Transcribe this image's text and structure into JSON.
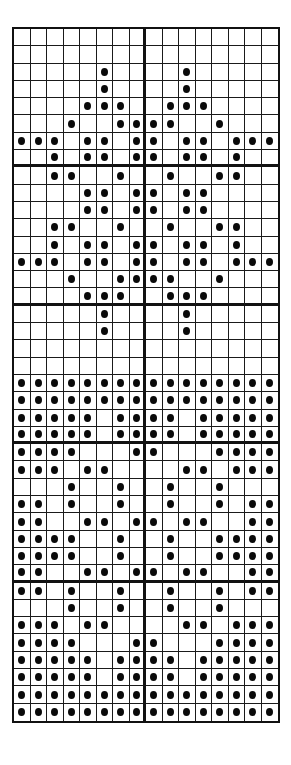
{
  "pattern": {
    "type": "knitting-chart",
    "columns": 16,
    "rows": 40,
    "major_grid_every_rows": 8,
    "major_grid_every_cols": 8,
    "symbol": "filled-dot",
    "symbol_color": "#0a0a0a",
    "grid_color": "#1a1a1a",
    "background_color": "#ffffff",
    "filled_cells_by_row": [
      [],
      [],
      [
        5,
        10
      ],
      [
        5,
        10
      ],
      [
        4,
        5,
        6,
        9,
        10,
        11
      ],
      [
        3,
        6,
        7,
        8,
        9,
        12
      ],
      [
        0,
        1,
        2,
        4,
        5,
        7,
        8,
        10,
        11,
        13,
        14,
        15
      ],
      [
        2,
        4,
        5,
        7,
        8,
        10,
        11,
        13
      ],
      [
        2,
        3,
        6,
        9,
        12,
        13
      ],
      [
        4,
        5,
        7,
        8,
        10,
        11
      ],
      [
        4,
        5,
        7,
        8,
        10,
        11
      ],
      [
        2,
        3,
        6,
        9,
        12,
        13
      ],
      [
        2,
        4,
        5,
        7,
        8,
        10,
        11,
        13
      ],
      [
        0,
        1,
        2,
        4,
        5,
        7,
        8,
        10,
        11,
        13,
        14,
        15
      ],
      [
        3,
        6,
        7,
        8,
        9,
        12
      ],
      [
        4,
        5,
        6,
        9,
        10,
        11
      ],
      [
        5,
        10
      ],
      [
        5,
        10
      ],
      [],
      [],
      [
        0,
        1,
        2,
        3,
        4,
        5,
        6,
        7,
        8,
        9,
        10,
        11,
        12,
        13,
        14,
        15
      ],
      [
        0,
        1,
        2,
        3,
        4,
        5,
        6,
        7,
        8,
        9,
        10,
        11,
        12,
        13,
        14,
        15
      ],
      [
        0,
        1,
        2,
        3,
        4,
        6,
        7,
        8,
        9,
        11,
        12,
        13,
        14,
        15
      ],
      [
        0,
        1,
        2,
        3,
        4,
        6,
        7,
        8,
        9,
        11,
        12,
        13,
        14,
        15
      ],
      [
        0,
        1,
        2,
        3,
        7,
        8,
        12,
        13,
        14,
        15
      ],
      [
        0,
        1,
        2,
        4,
        5,
        10,
        11,
        13,
        14,
        15
      ],
      [
        3,
        6,
        9,
        12
      ],
      [
        0,
        1,
        3,
        6,
        9,
        12,
        14,
        15
      ],
      [
        0,
        1,
        4,
        5,
        7,
        8,
        10,
        11,
        14,
        15
      ],
      [
        0,
        1,
        2,
        3,
        6,
        9,
        12,
        13,
        14,
        15
      ],
      [
        0,
        1,
        2,
        3,
        6,
        9,
        12,
        13,
        14,
        15
      ],
      [
        0,
        1,
        4,
        5,
        7,
        8,
        10,
        11,
        14,
        15
      ],
      [
        0,
        1,
        3,
        6,
        9,
        12,
        14,
        15
      ],
      [
        3,
        6,
        9,
        12
      ],
      [
        0,
        1,
        2,
        4,
        5,
        10,
        11,
        13,
        14,
        15
      ],
      [
        0,
        1,
        2,
        3,
        7,
        8,
        12,
        13,
        14,
        15
      ],
      [
        0,
        1,
        2,
        3,
        4,
        6,
        7,
        8,
        9,
        11,
        12,
        13,
        14,
        15
      ],
      [
        0,
        1,
        2,
        3,
        4,
        6,
        7,
        8,
        9,
        11,
        12,
        13,
        14,
        15
      ],
      [
        0,
        1,
        2,
        3,
        4,
        5,
        6,
        7,
        8,
        9,
        10,
        11,
        12,
        13,
        14,
        15
      ],
      [
        0,
        1,
        2,
        3,
        4,
        5,
        6,
        7,
        8,
        9,
        10,
        11,
        12,
        13,
        14,
        15
      ]
    ]
  }
}
